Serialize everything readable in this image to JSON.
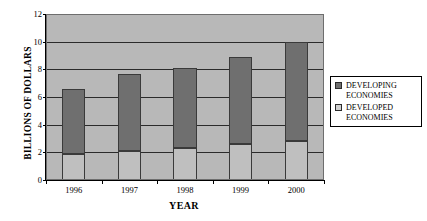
{
  "chart_data": {
    "type": "bar",
    "subtype": "stacked-column",
    "title": "",
    "xlabel": "YEAR",
    "ylabel": "BILLIONS OF DOLLARS",
    "categories": [
      "1996",
      "1997",
      "1998",
      "1999",
      "2000"
    ],
    "ylim": [
      0,
      12
    ],
    "yticks": [
      0,
      2,
      4,
      6,
      8,
      10,
      12
    ],
    "ytick_labels": [
      "0",
      "2",
      "4",
      "6",
      "8",
      "10",
      "12"
    ],
    "grid": true,
    "legend_position": "right",
    "series": [
      {
        "name": "DEVELOPED ECONOMIES",
        "color": "#bfbfbf",
        "values": [
          1.9,
          2.1,
          2.3,
          2.6,
          2.8
        ]
      },
      {
        "name": "DEVELOPING ECONOMIES",
        "color": "#6f6f6f",
        "values": [
          4.7,
          5.6,
          5.8,
          6.3,
          7.2
        ]
      }
    ],
    "totals": [
      6.6,
      7.7,
      8.1,
      8.9,
      10.0
    ]
  },
  "legend": {
    "entries": [
      {
        "line1": "DEVELOPING",
        "line2": "ECONOMIES",
        "swatch": "developing"
      },
      {
        "line1": "DEVELOPED",
        "line2": "ECONOMIES",
        "swatch": "developed"
      }
    ]
  }
}
